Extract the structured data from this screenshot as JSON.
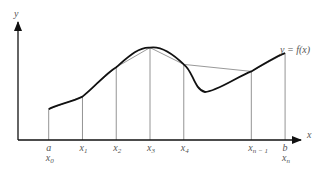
{
  "chart_data": {
    "type": "line",
    "title": "",
    "xlabel": "x",
    "ylabel": "y",
    "curve_label": "y = f(x)",
    "partition_labels": [
      {
        "top": "a",
        "base": "x",
        "sub": "0"
      },
      {
        "top": "",
        "base": "x",
        "sub": "1"
      },
      {
        "top": "",
        "base": "x",
        "sub": "2"
      },
      {
        "top": "",
        "base": "x",
        "sub": "3"
      },
      {
        "top": "",
        "base": "x",
        "sub": "4"
      },
      {
        "top": "",
        "base": "x",
        "sub": "n − 1"
      },
      {
        "top": "b",
        "base": "x",
        "sub": "n"
      }
    ],
    "partition_x": [
      0.1,
      0.21,
      0.32,
      0.43,
      0.54,
      0.76,
      0.87
    ],
    "partition_y": [
      0.22,
      0.31,
      0.52,
      0.66,
      0.54,
      0.49,
      0.62
    ]
  }
}
